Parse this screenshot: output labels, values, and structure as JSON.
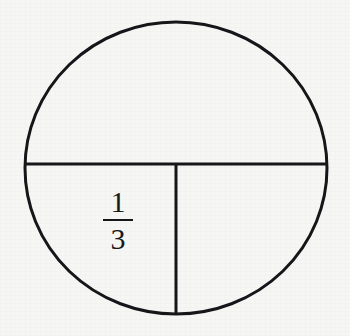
{
  "figure": {
    "background_color": "#f6f6f4",
    "stroke_color": "#16161a",
    "text_color": "#18181a",
    "circle": {
      "center_x": 176,
      "center_y": 168,
      "radius_x": 151,
      "radius_y": 146,
      "stroke_width": 3
    },
    "dividers": [
      {
        "name": "horizontal-diameter",
        "x1": 25,
        "y1": 164,
        "x2": 327,
        "y2": 164,
        "stroke_width": 3
      },
      {
        "name": "vertical-radius",
        "x1": 176,
        "y1": 164,
        "x2": 176,
        "y2": 314,
        "stroke_width": 3
      }
    ],
    "regions": [
      {
        "name": "top-half",
        "label": ""
      },
      {
        "name": "bottom-left-quarter",
        "label": "1/3"
      },
      {
        "name": "bottom-right-quarter",
        "label": ""
      }
    ],
    "fraction_label": {
      "numerator": "1",
      "denominator": "3",
      "center_x": 118,
      "center_y": 220
    }
  }
}
